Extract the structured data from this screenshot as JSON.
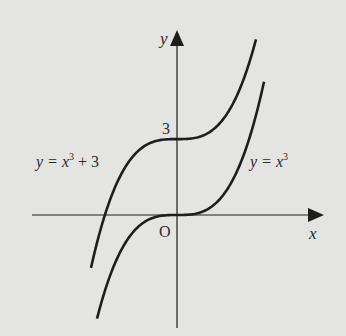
{
  "chart_data": {
    "type": "line",
    "title": "",
    "xlabel": "x",
    "ylabel": "y",
    "origin_label": "O",
    "xlim": [
      -2.9,
      2.95
    ],
    "ylim": [
      -4.5,
      7.4
    ],
    "grid": false,
    "annotations": [
      {
        "text": "3",
        "x": 0,
        "y": 3
      }
    ],
    "series": [
      {
        "name": "y = x³ + 3",
        "label_main": "y = x",
        "label_sup": "3",
        "label_tail": " + 3",
        "formula": "x^3+3",
        "x_range": [
          -1.72,
          1.58
        ],
        "label_position": "left"
      },
      {
        "name": "y = x³",
        "label_main": "y = x",
        "label_sup": "3",
        "label_tail": "",
        "formula": "x^3",
        "x_range": [
          -1.6,
          1.74
        ],
        "label_position": "right"
      }
    ]
  },
  "colors": {
    "background": "#e4e4e2",
    "ink": "#1e1e1e"
  }
}
